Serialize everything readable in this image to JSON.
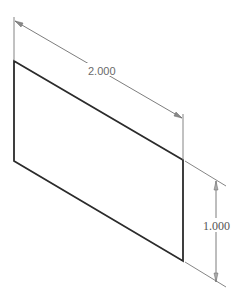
{
  "drawing": {
    "type": "isometric sketch",
    "shape": "parallelogram face (rectangle in isometric view)",
    "colors": {
      "outline": "#2b2b2b",
      "dimension_line": "#6e6e6e",
      "text": "#666666",
      "background": "#ffffff"
    }
  },
  "dimensions": {
    "width": {
      "label": "2.000"
    },
    "height": {
      "label": "1.000"
    }
  }
}
